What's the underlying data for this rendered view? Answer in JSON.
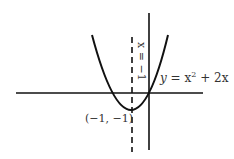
{
  "diagram": {
    "equation_label": {
      "y": "y",
      "eq": " = x",
      "exp": "2",
      "rest": " + 2x"
    },
    "asymptote_label": "x = −1",
    "vertex_label": "(−1, −1)",
    "axes": {
      "x_axis": true,
      "y_axis": true
    },
    "curve": "y = x^2 + 2x",
    "vertex": [
      -1,
      -1
    ],
    "line_of_symmetry": "x = -1",
    "colors": {
      "stroke": "#111111",
      "text": "#333333"
    }
  }
}
